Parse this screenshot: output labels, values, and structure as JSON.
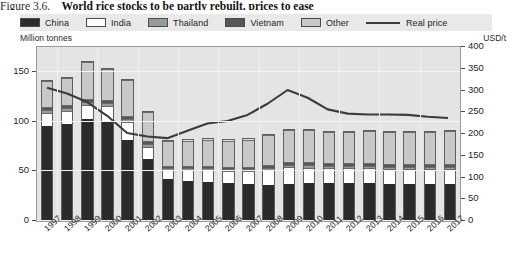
{
  "figure": {
    "number": "Figure 3.6.",
    "title": "World rice stocks to be partly rebuilt, prices to ease"
  },
  "legend": {
    "items": [
      {
        "label": "China",
        "swatch": "legend-swatch-china",
        "color": "#2b2b2b",
        "type": "area"
      },
      {
        "label": "India",
        "swatch": "legend-swatch-india",
        "color": "#ffffff",
        "type": "area"
      },
      {
        "label": "Thailand",
        "swatch": "legend-swatch-thailand",
        "color": "#9a9a9a",
        "type": "area"
      },
      {
        "label": "Vietnam",
        "swatch": "legend-swatch-vietnam",
        "color": "#575757",
        "type": "area"
      },
      {
        "label": "Other",
        "swatch": "legend-swatch-other",
        "color": "#c8c8c8",
        "type": "area"
      },
      {
        "label": "Real price",
        "swatch": "legend-line-real-price",
        "color": "#3b3b3b",
        "type": "line"
      }
    ]
  },
  "axes": {
    "left_unit": "Million tonnes",
    "right_unit": "USD/t",
    "left_ticks": [
      "150",
      "100",
      "50",
      "0"
    ],
    "right_ticks": [
      "400",
      "350",
      "300",
      "250",
      "200",
      "150",
      "100",
      "50",
      "0"
    ]
  },
  "chart_data": {
    "type": "bar",
    "title": "World rice stocks to be partly rebuilt, prices to ease",
    "xlabel": "",
    "ylabel": "Million tonnes",
    "y2label": "USD/t",
    "ylim": [
      0,
      175
    ],
    "y2lim": [
      0,
      400
    ],
    "grid": true,
    "legend_position": "top",
    "categories": [
      "1997",
      "1998",
      "1999",
      "2000",
      "2001",
      "2002",
      "2003",
      "2004",
      "2005",
      "2006",
      "2007",
      "2008",
      "2009",
      "2010",
      "2011",
      "2012",
      "2013",
      "2014",
      "2015",
      "2016",
      "2017"
    ],
    "series": [
      {
        "name": "China",
        "color": "#2b2b2b",
        "values": [
          96,
          98,
          103,
          100,
          82,
          62,
          42,
          40,
          39,
          38,
          37,
          36,
          37,
          38,
          38,
          38,
          38,
          37,
          37,
          37,
          37
        ]
      },
      {
        "name": "India",
        "color": "#ffffff",
        "values": [
          13,
          13,
          14,
          16,
          18,
          13,
          10,
          12,
          13,
          13,
          14,
          16,
          17,
          16,
          15,
          15,
          15,
          15,
          15,
          15,
          15
        ]
      },
      {
        "name": "Thailand",
        "color": "#9a9a9a",
        "values": [
          3,
          3,
          3,
          3,
          3,
          3,
          2,
          2,
          2,
          2,
          2,
          2,
          3,
          3,
          3,
          3,
          3,
          3,
          3,
          3,
          3
        ]
      },
      {
        "name": "Vietnam",
        "color": "#575757",
        "values": [
          3,
          3,
          3,
          3,
          3,
          3,
          2,
          2,
          2,
          2,
          2,
          3,
          3,
          3,
          3,
          3,
          3,
          3,
          3,
          3,
          3
        ]
      },
      {
        "name": "Other",
        "color": "#c8c8c8",
        "values": [
          27,
          28,
          38,
          32,
          37,
          30,
          25,
          26,
          27,
          27,
          28,
          31,
          33,
          33,
          32,
          32,
          33,
          33,
          33,
          33,
          34
        ]
      }
    ],
    "line_series": {
      "name": "Real price",
      "color": "#3b3b3b",
      "axis": "right",
      "values": [
        305,
        292,
        272,
        240,
        200,
        192,
        188,
        205,
        222,
        228,
        242,
        268,
        300,
        282,
        255,
        245,
        243,
        243,
        242,
        238,
        235
      ]
    }
  }
}
